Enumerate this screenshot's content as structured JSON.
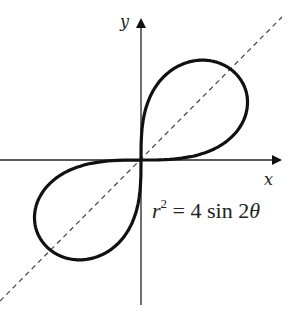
{
  "chart_data": {
    "type": "line",
    "title": "",
    "curve": "lemniscate",
    "equation": "r^2 = 4 sin 2θ",
    "xlabel": "x",
    "ylabel": "y",
    "max_radius": 2,
    "symmetry_line": "y = x (dashed)",
    "grid": false,
    "ticks": false
  },
  "labels": {
    "x_axis": "x",
    "y_axis": "y",
    "eq_r": "r",
    "eq_exp": "2",
    "eq_rest": " = 4 sin 2",
    "eq_theta": "θ"
  }
}
